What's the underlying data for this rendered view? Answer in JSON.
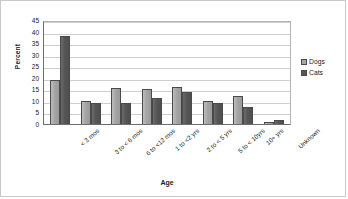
{
  "chart_data": {
    "type": "bar",
    "title": "",
    "xlabel": "Age",
    "ylabel": "Percent",
    "ylim": [
      0,
      45
    ],
    "ytick_step": 5,
    "yticks": [
      45,
      40,
      35,
      30,
      25,
      20,
      15,
      10,
      5,
      0
    ],
    "grid": true,
    "legend_position": "right",
    "categories": [
      "< 3 mos",
      "3 to < 6 mos",
      "6 to <12 mos",
      "1 to <2 yrs",
      "2 to < 5 yrs",
      "5 to < 10yrs",
      "10+ yrs",
      "Unknown"
    ],
    "series": [
      {
        "name": "Dogs",
        "color": "#a5a5a5",
        "values": [
          19.0,
          10.0,
          15.6,
          15.3,
          16.2,
          9.8,
          12.0,
          0.8
        ]
      },
      {
        "name": "Cats",
        "color": "#565656",
        "values": [
          38.1,
          9.3,
          9.0,
          11.4,
          14.0,
          9.2,
          7.2,
          1.8
        ]
      }
    ]
  },
  "legend": {
    "items": [
      {
        "label": "Dogs"
      },
      {
        "label": "Cats"
      }
    ]
  }
}
